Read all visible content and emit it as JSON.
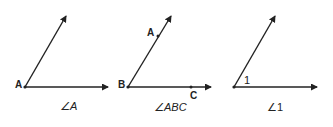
{
  "figure": {
    "angles": [
      {
        "vertex_label": "A",
        "caption": "∠A",
        "points": []
      },
      {
        "vertex_label": "B",
        "caption": "∠ABC",
        "points": [
          "A",
          "C"
        ]
      },
      {
        "vertex_label": "1",
        "caption": "∠1",
        "points": []
      }
    ]
  },
  "colors": {
    "stroke": "#222222",
    "background": "#ffffff"
  }
}
